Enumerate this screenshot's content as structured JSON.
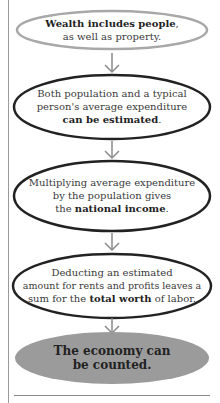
{
  "diagram": {
    "type": "flowchart",
    "direction": "top-to-bottom",
    "colors": {
      "first_outline": "#a8a8a8",
      "outline": "#222222",
      "arrow": "#8a8a8a",
      "final_fill": "#9b9b9b",
      "text": "#3a3a3a"
    },
    "nodes": [
      {
        "id": "n1",
        "bold": "Wealth includes people",
        "after": ",",
        "line2": "as well as property."
      },
      {
        "id": "n2",
        "line1": "Both population and a typical",
        "line2": "person's average expenditure",
        "bold": "can be estimated",
        "after": "."
      },
      {
        "id": "n3",
        "line1": "Multiplying average expenditure",
        "line2": "by the population gives",
        "before": "the ",
        "bold": "national income",
        "after": "."
      },
      {
        "id": "n4",
        "line1": "Deducting an estimated",
        "line2": "amount for rents and profits leaves a",
        "before": "sum for the ",
        "bold": "total worth",
        "after": " of labor."
      },
      {
        "id": "n5",
        "line1": "The economy can",
        "line2": "be counted."
      }
    ],
    "edges": [
      {
        "from": "n1",
        "to": "n2"
      },
      {
        "from": "n2",
        "to": "n3"
      },
      {
        "from": "n3",
        "to": "n4"
      },
      {
        "from": "n4",
        "to": "n5"
      }
    ]
  }
}
